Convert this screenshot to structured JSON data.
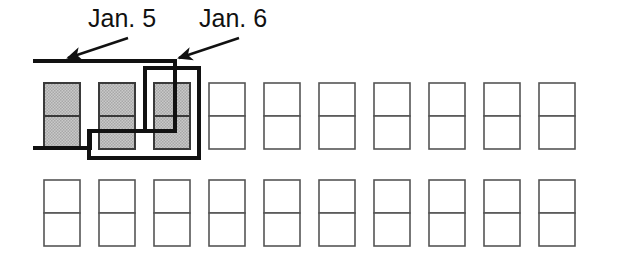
{
  "diagram": {
    "type": "schematic",
    "background_color": "#ffffff",
    "labels": [
      {
        "id": "jan5",
        "text": "Jan. 5",
        "x": 88,
        "y": 4,
        "arrow": {
          "from_x": 128,
          "from_y": 38,
          "to_x": 68,
          "to_y": 58
        }
      },
      {
        "id": "jan6",
        "text": "Jan. 6",
        "x": 199,
        "y": 4,
        "arrow": {
          "from_x": 239,
          "from_y": 38,
          "to_x": 179,
          "to_y": 58
        }
      }
    ],
    "grid": {
      "columns": 10,
      "rows": 2,
      "cells_per_unit": 2,
      "unit_width": 36,
      "unit_height": 66,
      "column_pitch": 55,
      "first_column_x": 44,
      "row_tops": [
        83,
        180
      ],
      "cell_border_color": "#555555",
      "cell_fill_empty": "#ffffff",
      "cell_fill_shaded": "#bdbdbd",
      "shaded_units": [
        {
          "row": 0,
          "column": 0
        },
        {
          "row": 0,
          "column": 1
        },
        {
          "row": 0,
          "column": 2
        }
      ]
    },
    "outlines": [
      {
        "id": "jan5-outline",
        "label_ref": "jan5",
        "stroke": "#111111",
        "stroke_width": 4,
        "fill": "none",
        "covers_columns": [
          0,
          1
        ],
        "points": "35,61 175,61 175,131 90,131 90,148 35,148"
      },
      {
        "id": "jan6-outline",
        "label_ref": "jan6",
        "stroke": "#111111",
        "stroke_width": 4,
        "fill": "none",
        "covers_columns": [
          1,
          2
        ],
        "points": "89,131 89,158 199,158 199,68 145,68 145,131"
      }
    ]
  }
}
